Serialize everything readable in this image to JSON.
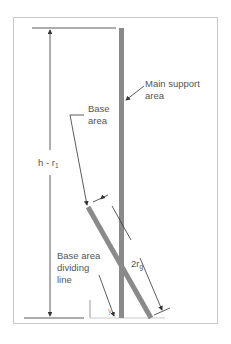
{
  "diagram": {
    "labels": {
      "main_support": [
        "Main support",
        "area"
      ],
      "base_area": [
        "Base",
        "area"
      ],
      "height": {
        "main": "h - r",
        "sub": "1"
      },
      "radius": {
        "main": "2r",
        "sub": "g"
      },
      "dividing_line": [
        "Base area",
        "dividing",
        "line"
      ],
      "angle": "γ"
    },
    "colors": {
      "support": "#8a8a8a",
      "line": "#333333",
      "frame": "#c8c8c8"
    }
  }
}
